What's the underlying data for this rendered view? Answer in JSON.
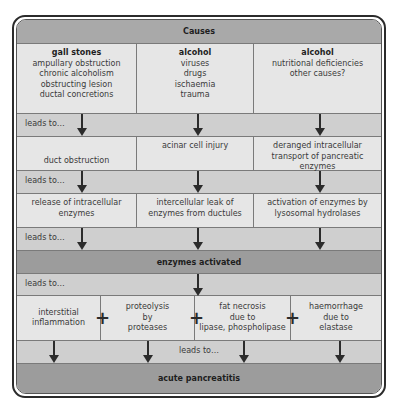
{
  "header": {
    "title": "Causes"
  },
  "causes": [
    {
      "title": "gall stones",
      "items": [
        "ampullary obstruction",
        "chronic alcoholism",
        "obstructing lesion",
        "ductal concretions"
      ]
    },
    {
      "title": "alcohol",
      "items": [
        "viruses",
        "drugs",
        "ischaemia",
        "trauma"
      ]
    },
    {
      "title": "alcohol",
      "items": [
        "nutritional deficiencies",
        "other causes?"
      ]
    }
  ],
  "leads_to_label": "leads to…",
  "mechanisms": [
    "duct obstruction",
    "acinar cell injury",
    "deranged intracellular transport of pancreatic enzymes"
  ],
  "releases": [
    "release of intracellular enzymes",
    "intercellular leak of enzymes from ductules",
    "activation of enzymes by lysosomal hydrolases"
  ],
  "enzymes_activated": "enzymes activated",
  "effects": [
    {
      "lines": [
        "interstitial",
        "inflammation"
      ]
    },
    {
      "lines": [
        "proteolysis",
        "by",
        "proteases"
      ]
    },
    {
      "lines": [
        "fat necrosis",
        "due to",
        "lipase, phospholipase"
      ]
    },
    {
      "lines": [
        "haemorrhage",
        "due to",
        "elastase"
      ]
    }
  ],
  "plus_symbol": "+",
  "outcome": "acute pancreatitis",
  "colors": {
    "header_bg": "#a9a9a9",
    "cell_bg": "#e6e6e6",
    "leads_bg": "#cfcfcf",
    "dark_bg": "#9c9c9c",
    "line": "#2b2b2b"
  }
}
